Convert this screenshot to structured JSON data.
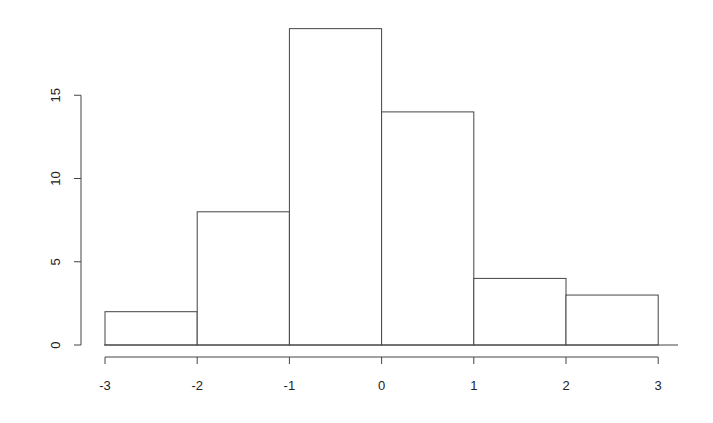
{
  "chart_data": {
    "type": "bar",
    "subtype": "histogram",
    "title": "",
    "xlabel": "",
    "ylabel": "",
    "bins": [
      {
        "from": -3,
        "to": -2,
        "count": 2
      },
      {
        "from": -2,
        "to": -1,
        "count": 8
      },
      {
        "from": -1,
        "to": 0,
        "count": 19
      },
      {
        "from": 0,
        "to": 1,
        "count": 14
      },
      {
        "from": 1,
        "to": 2,
        "count": 4
      },
      {
        "from": 2,
        "to": 3,
        "count": 3
      }
    ],
    "categories": [
      "-3 to -2",
      "-2 to -1",
      "-1 to 0",
      "0 to 1",
      "1 to 2",
      "2 to 3"
    ],
    "values": [
      2,
      8,
      19,
      14,
      4,
      3
    ],
    "x_ticks": [
      "-3",
      "-2",
      "-1",
      "0",
      "1",
      "2",
      "3"
    ],
    "y_ticks": [
      "0",
      "5",
      "10",
      "15"
    ],
    "xlim": [
      -3,
      3
    ],
    "ylim": [
      0,
      19
    ],
    "grid": false,
    "legend": null,
    "colors": {
      "bar_fill": "#ffffff",
      "bar_stroke": "#444444",
      "axis": "#444444"
    }
  }
}
